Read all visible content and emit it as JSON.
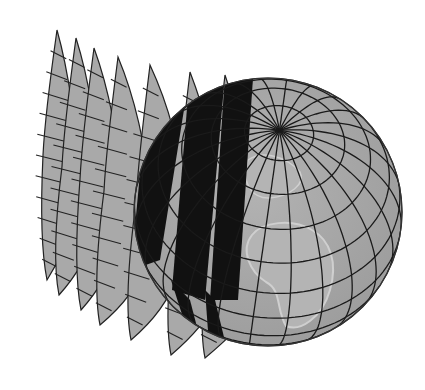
{
  "illustration": {
    "subject": "globe with peeled map gores",
    "colors": {
      "background": "#ffffff",
      "sphere_fill": "#a6a6a6",
      "land_fill": "#b4b4b4",
      "land_outline": "#cfcfcf",
      "grid_line": "#1a1a1a",
      "shadow": "#111111",
      "gore_fill": "#a9a9a9"
    },
    "globe": {
      "cx": 268,
      "cy": 212,
      "r": 134,
      "tilt_deg": 52,
      "rotate_deg": -8,
      "parallel_step_deg": 15,
      "meridian_step_deg": 15
    },
    "gores": [
      {
        "top": [
          57,
          30
        ],
        "bottom": [
          47,
          280
        ],
        "base_top": [
          76,
          200
        ],
        "base_bottom": [
          70,
          215
        ]
      },
      {
        "top": [
          76,
          38
        ],
        "bottom": [
          59,
          295
        ],
        "base_top": [
          97,
          200
        ],
        "base_bottom": [
          90,
          230
        ]
      },
      {
        "top": [
          94,
          48
        ],
        "bottom": [
          81,
          310
        ],
        "base_top": [
          118,
          200
        ],
        "base_bottom": [
          112,
          245
        ]
      },
      {
        "top": [
          118,
          57
        ],
        "bottom": [
          100,
          325
        ],
        "base_top": [
          145,
          200
        ],
        "base_bottom": [
          140,
          262
        ]
      },
      {
        "top": [
          150,
          65
        ],
        "bottom": [
          131,
          340
        ],
        "base_top": [
          180,
          200
        ],
        "base_bottom": [
          170,
          278
        ]
      },
      {
        "top": [
          190,
          72
        ],
        "bottom": [
          171,
          355
        ],
        "base_top": [
          215,
          195
        ],
        "base_bottom": [
          210,
          300
        ]
      },
      {
        "top": [
          225,
          75
        ],
        "bottom": [
          205,
          358
        ],
        "base_top": [
          248,
          190
        ],
        "base_bottom": [
          245,
          310
        ]
      }
    ],
    "shadows": [
      {
        "points": [
          [
            150,
            65
          ],
          [
            190,
            72
          ],
          [
            160,
            260
          ],
          [
            131,
            270
          ]
        ]
      },
      {
        "points": [
          [
            190,
            72
          ],
          [
            225,
            75
          ],
          [
            205,
            300
          ],
          [
            172,
            290
          ]
        ]
      },
      {
        "points": [
          [
            225,
            75
          ],
          [
            253,
            78
          ],
          [
            238,
            300
          ],
          [
            210,
            300
          ]
        ]
      },
      {
        "points": [
          [
            128,
            280
          ],
          [
            150,
            300
          ],
          [
            171,
            355
          ],
          [
            160,
            352
          ]
        ]
      },
      {
        "points": [
          [
            171,
            280
          ],
          [
            190,
            300
          ],
          [
            205,
            358
          ],
          [
            195,
            355
          ]
        ]
      },
      {
        "points": [
          [
            205,
            290
          ],
          [
            215,
            300
          ],
          [
            230,
            362
          ],
          [
            210,
            358
          ]
        ]
      }
    ]
  }
}
